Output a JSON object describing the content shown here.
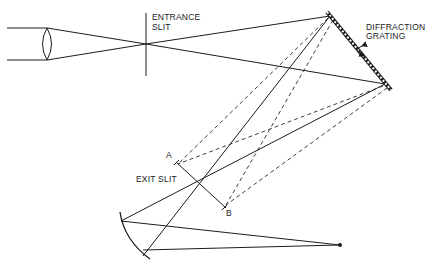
{
  "diagram": {
    "type": "optical-monochromator-schematic",
    "labels": {
      "entrance_slit_line1": "ENTRANCE",
      "entrance_slit_line2": "SLIT",
      "grating_line1": "DIFFRACTION",
      "grating_line2": "GRATING",
      "exit_slit": "EXIT SLIT",
      "point_a": "A",
      "point_b": "B"
    },
    "components": [
      {
        "name": "collimating-lens",
        "label": ""
      },
      {
        "name": "entrance-slit",
        "label": "ENTRANCE SLIT"
      },
      {
        "name": "diffraction-grating",
        "label": "DIFFRACTION GRATING",
        "rotatable": true
      },
      {
        "name": "exit-slit",
        "label": "EXIT SLIT",
        "endpoints": [
          "A",
          "B"
        ]
      },
      {
        "name": "concave-mirror",
        "label": ""
      },
      {
        "name": "focal-point",
        "label": ""
      }
    ],
    "colors": {
      "line": "#1c1c1c",
      "background": "#ffffff"
    }
  }
}
